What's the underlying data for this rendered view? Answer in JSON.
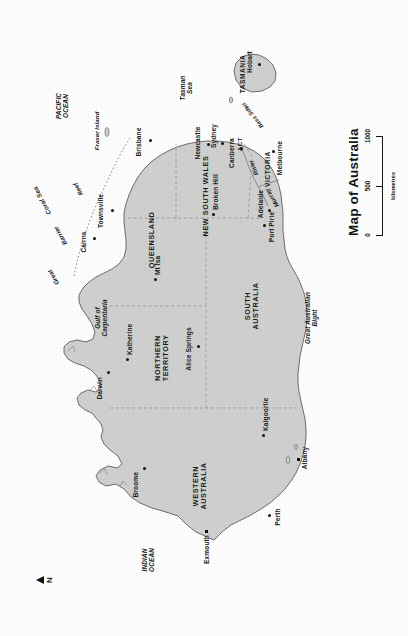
{
  "document": {
    "type": "map",
    "title": "Map of Australia",
    "orientation_note": "sheet displayed rotated 90 degrees (north points left)"
  },
  "colors": {
    "land_fill": "#cfcfcf",
    "land_stroke": "#6d6d6d",
    "ocean": "#fdfdfd",
    "border_dashed": "#9a9a9a",
    "text": "#1b1b1b",
    "river": "#8a8a8a"
  },
  "compass": {
    "label": "N",
    "icon": "north-arrow-icon"
  },
  "scale": {
    "units": "kilometres",
    "ticks": [
      "0",
      "500",
      "1000"
    ]
  },
  "states": [
    {
      "id": "wa",
      "lines": [
        "WESTERN",
        "AUSTRALIA"
      ]
    },
    {
      "id": "nt",
      "lines": [
        "NORTHERN",
        "TERRITORY"
      ]
    },
    {
      "id": "sa",
      "lines": [
        "SOUTH",
        "AUSTRALIA"
      ]
    },
    {
      "id": "qld",
      "lines": [
        "QUEENSLAND"
      ]
    },
    {
      "id": "nsw",
      "lines": [
        "NEW SOUTH WALES"
      ]
    },
    {
      "id": "vic",
      "lines": [
        "VICTORIA"
      ]
    },
    {
      "id": "tas",
      "lines": [
        "TASMANIA"
      ]
    },
    {
      "id": "act",
      "lines": [
        "ACT"
      ]
    }
  ],
  "cities": [
    {
      "id": "darwin",
      "name": "Darwin"
    },
    {
      "id": "katherine",
      "name": "Katherine"
    },
    {
      "id": "broome",
      "name": "Broome"
    },
    {
      "id": "exmouth",
      "name": "Exmouth"
    },
    {
      "id": "perth",
      "name": "Perth"
    },
    {
      "id": "albany",
      "name": "Albany"
    },
    {
      "id": "kalgoorlie",
      "name": "Kalgoorlie"
    },
    {
      "id": "alice-springs",
      "name": "Alice Springs"
    },
    {
      "id": "mt-isa",
      "name": "Mt Isa"
    },
    {
      "id": "cairns",
      "name": "Cairns"
    },
    {
      "id": "townsville",
      "name": "Townsville"
    },
    {
      "id": "brisbane",
      "name": "Brisbane"
    },
    {
      "id": "newcastle",
      "name": "Newcastle"
    },
    {
      "id": "sydney",
      "name": "Sydney"
    },
    {
      "id": "canberra",
      "name": "Canberra"
    },
    {
      "id": "broken-hill",
      "name": "Broken Hill"
    },
    {
      "id": "port-pirie",
      "name": "Port Pirie"
    },
    {
      "id": "adelaide",
      "name": "Adelaide"
    },
    {
      "id": "melbourne",
      "name": "Melbourne"
    },
    {
      "id": "hobart",
      "name": "Hobart"
    }
  ],
  "water_labels": [
    {
      "id": "indian-ocean",
      "lines": [
        "INDIAN",
        "OCEAN"
      ]
    },
    {
      "id": "pacific-ocean",
      "lines": [
        "PACIFIC",
        "OCEAN"
      ]
    },
    {
      "id": "coral-sea",
      "lines": [
        "Coral Sea"
      ]
    },
    {
      "id": "tasman-sea",
      "lines": [
        "Tasman",
        "Sea"
      ]
    },
    {
      "id": "gulf-of-carpentaria",
      "lines": [
        "Gulf of",
        "Carpentaria"
      ]
    },
    {
      "id": "great-australian-bight",
      "lines": [
        "Great Australian",
        "Bight"
      ]
    },
    {
      "id": "bass-strait",
      "lines": [
        "Bass Strait"
      ]
    }
  ],
  "features": [
    {
      "id": "great-barrier-reef",
      "words": [
        "Great",
        "Barrier",
        "Reef"
      ]
    },
    {
      "id": "fraser-island",
      "name": "Fraser Island"
    },
    {
      "id": "murray-river",
      "words": [
        "Murray",
        "River"
      ]
    }
  ]
}
